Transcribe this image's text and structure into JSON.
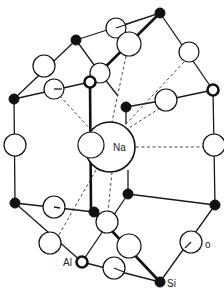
{
  "diagram": {
    "labels": {
      "na": "Na",
      "al": "Al",
      "si": "Si",
      "o": "o"
    },
    "colors": {
      "line": "#1a1a1a",
      "fill_si": "#111111",
      "fill_o": "#ffffff",
      "background": "#ffffff"
    },
    "atoms": {
      "si": [
        [
          160,
          13
        ],
        [
          76,
          40
        ],
        [
          14,
          99
        ],
        [
          126,
          107
        ],
        [
          128,
          194
        ],
        [
          94,
          212
        ],
        [
          215,
          205
        ],
        [
          160,
          282
        ],
        [
          15,
          203
        ]
      ],
      "al": [
        [
          90,
          82
        ],
        [
          213,
          90
        ],
        [
          82,
          262
        ]
      ],
      "o": [
        [
          116,
          28,
          10
        ],
        [
          129,
          44,
          12
        ],
        [
          44,
          66,
          11
        ],
        [
          100,
          73,
          10
        ],
        [
          54,
          89,
          10
        ],
        [
          189,
          52,
          10
        ],
        [
          166,
          100,
          11
        ],
        [
          15,
          145,
          11
        ],
        [
          91,
          145,
          13
        ],
        [
          214,
          145,
          11
        ],
        [
          54,
          207,
          11
        ],
        [
          107,
          222,
          11
        ],
        [
          50,
          243,
          11
        ],
        [
          129,
          246,
          12
        ],
        [
          114,
          268,
          11
        ],
        [
          191,
          242,
          11
        ]
      ],
      "na": [
        110,
        147,
        25
      ]
    }
  }
}
